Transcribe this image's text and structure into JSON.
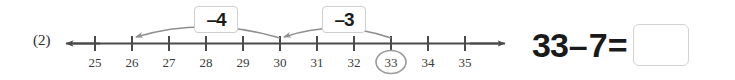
{
  "problem": {
    "number_label": "(2)"
  },
  "number_line": {
    "tick_labels": [
      "25",
      "26",
      "27",
      "28",
      "29",
      "30",
      "31",
      "32",
      "33",
      "34",
      "35"
    ],
    "circled_value": "33",
    "left_arrow": "left-arrowhead",
    "right_arrow": "right-arrowhead",
    "axis_color": "#4a4a4a",
    "highlight_color": "#9a9a9a"
  },
  "jumps": [
    {
      "label": "–4",
      "from": "30",
      "to": "26"
    },
    {
      "label": "–3",
      "from": "33",
      "to": "30"
    }
  ],
  "equation": {
    "left_operand": "33",
    "operator": "–",
    "right_operand": "7",
    "equals": "=",
    "answer_value": ""
  }
}
